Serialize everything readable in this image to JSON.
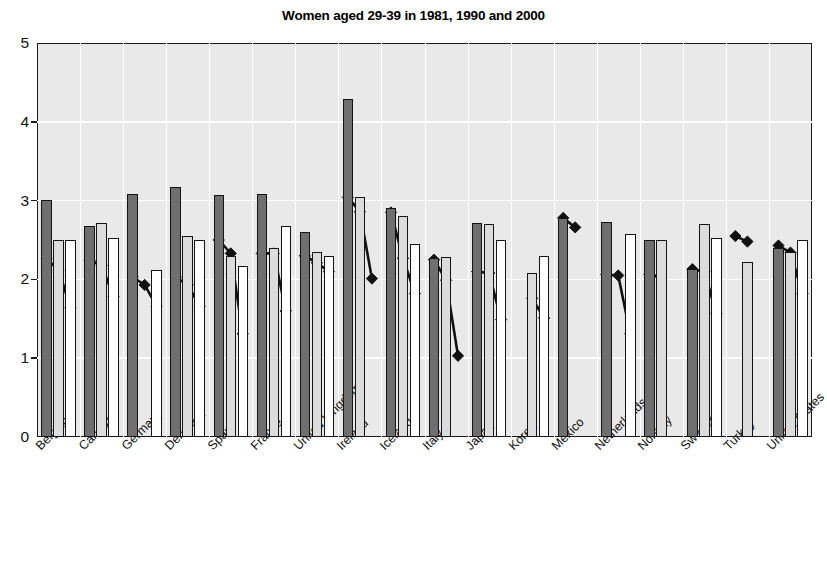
{
  "chart_data": {
    "type": "bar",
    "title": "Women aged 29-39 in 1981, 1990 and 2000",
    "xlabel": "",
    "ylabel": "",
    "ylim": [
      0,
      5
    ],
    "yticks": [
      0,
      1,
      2,
      3,
      4,
      5
    ],
    "grid": "horizontal-and-vertical-white",
    "legend": "none",
    "categories": [
      "Belgium",
      "Canada",
      "Germany",
      "Denmark",
      "Spain",
      "France",
      "United Kingdom",
      "Ireland",
      "Iceland",
      "Italy",
      "Japan",
      "Korea",
      "Mexico",
      "Netherlands",
      "Norway",
      "Sweden",
      "Turkey",
      "United States"
    ],
    "series": [
      {
        "name": "1981",
        "type": "bar",
        "color": "#6f6f6f",
        "values": [
          3.01,
          2.68,
          3.08,
          3.17,
          3.07,
          3.08,
          2.6,
          4.29,
          2.9,
          2.27,
          2.72,
          null,
          2.78,
          2.73,
          2.5,
          2.13,
          null,
          2.4
        ]
      },
      {
        "name": "1990",
        "type": "bar",
        "color": "#dcdcdc",
        "values": [
          2.5,
          2.72,
          null,
          2.55,
          2.3,
          2.4,
          2.35,
          3.05,
          2.8,
          2.28,
          2.7,
          2.08,
          null,
          null,
          2.5,
          2.7,
          2.22,
          2.35
        ]
      },
      {
        "name": "2000",
        "type": "bar",
        "color": "#ffffff",
        "values": [
          2.5,
          2.53,
          2.12,
          2.5,
          2.17,
          2.68,
          2.3,
          null,
          2.45,
          null,
          2.5,
          2.3,
          null,
          2.57,
          null,
          2.53,
          null,
          2.5
        ]
      },
      {
        "name": "1981-marker",
        "type": "line-marker",
        "color": "#111111",
        "values": [
          2.26,
          2.24,
          2.03,
          2.03,
          2.5,
          2.33,
          2.3,
          3.04,
          2.85,
          2.25,
          2.1,
          null,
          2.78,
          2.06,
          2.06,
          2.13,
          2.55,
          2.43
        ]
      },
      {
        "name": "1990-marker",
        "type": "line-marker",
        "color": "#111111",
        "values": [
          2.12,
          2.18,
          1.93,
          1.93,
          2.33,
          2.33,
          2.21,
          2.86,
          2.27,
          1.99,
          2.08,
          1.76,
          2.66,
          2.05,
          2.03,
          2.1,
          2.48,
          2.34
        ]
      },
      {
        "name": "2000-marker",
        "type": "line-marker",
        "color": "#111111",
        "values": [
          1.64,
          1.78,
          1.66,
          1.66,
          1.31,
          1.6,
          2.1,
          2.01,
          1.82,
          1.03,
          1.49,
          1.51,
          null,
          1.31,
          null,
          1.57,
          null,
          1.82
        ]
      }
    ]
  }
}
